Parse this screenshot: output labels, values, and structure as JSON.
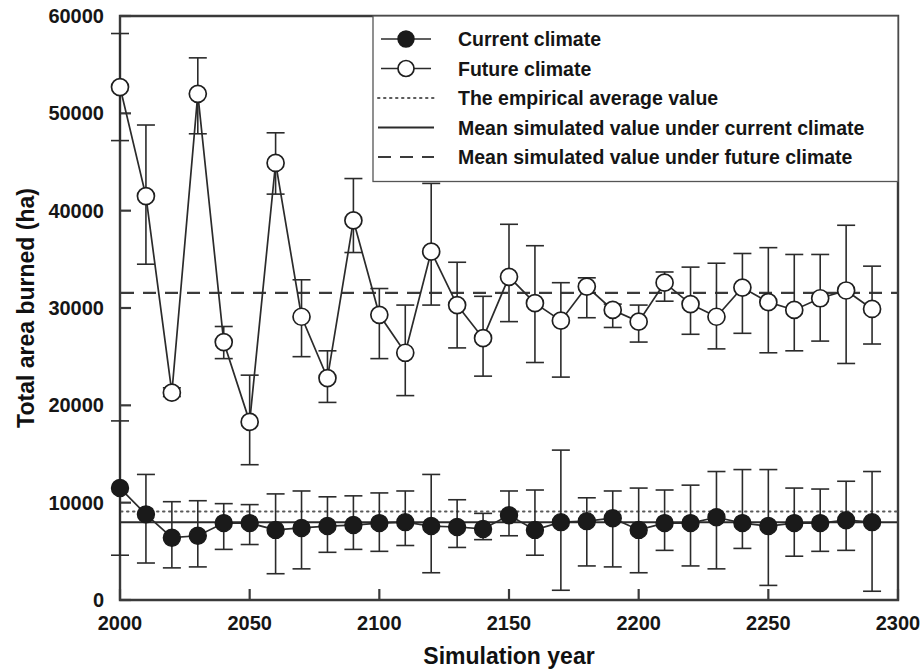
{
  "chart_data": {
    "type": "line",
    "title": "",
    "xlabel": "Simulation year",
    "ylabel": "Total area burned (ha)",
    "xlim": [
      2000,
      2300
    ],
    "ylim": [
      0,
      60000
    ],
    "xticks": [
      2000,
      2050,
      2100,
      2150,
      2200,
      2250,
      2300
    ],
    "yticks": [
      0,
      10000,
      20000,
      30000,
      40000,
      50000,
      60000
    ],
    "xtick_labels": [
      "2000",
      "2050",
      "2100",
      "2150",
      "2200",
      "2250",
      "2300"
    ],
    "ytick_labels": [
      "0",
      "10000",
      "20000",
      "30000",
      "40000",
      "50000",
      "60000"
    ],
    "grid": false,
    "legend_position": "top-right",
    "x": [
      2000,
      2010,
      2020,
      2030,
      2040,
      2050,
      2060,
      2070,
      2080,
      2090,
      2100,
      2110,
      2120,
      2130,
      2140,
      2150,
      2160,
      2170,
      2180,
      2190,
      2200,
      2210,
      2220,
      2230,
      2240,
      2250,
      2260,
      2270,
      2280,
      2290
    ],
    "series": [
      {
        "name": "Current climate",
        "marker": "filled-circle",
        "values": [
          11500,
          8800,
          6400,
          6600,
          7900,
          7900,
          7200,
          7400,
          7600,
          7700,
          7900,
          8000,
          7600,
          7500,
          7300,
          8700,
          7200,
          8000,
          8100,
          8400,
          7200,
          7900,
          7900,
          8500,
          7900,
          7600,
          7900,
          7900,
          8200,
          8000
        ],
        "err_low": [
          4600,
          3800,
          3300,
          3400,
          5200,
          5700,
          2700,
          3200,
          4900,
          5200,
          5000,
          5600,
          2800,
          5400,
          6200,
          6600,
          4600,
          1000,
          3500,
          3400,
          2800,
          5100,
          3500,
          3200,
          5300,
          1500,
          4500,
          5000,
          5100,
          900
        ],
        "err_high": [
          18400,
          12900,
          10100,
          10200,
          9900,
          9800,
          10900,
          11200,
          10600,
          10700,
          11000,
          11200,
          12900,
          10300,
          8900,
          11200,
          11300,
          15400,
          10500,
          11200,
          11500,
          11300,
          11800,
          13200,
          13400,
          13400,
          11500,
          11400,
          12200,
          13200
        ]
      },
      {
        "name": "Future climate",
        "marker": "open-circle",
        "values": [
          52700,
          41500,
          21300,
          52000,
          26500,
          18300,
          44900,
          29100,
          22800,
          39000,
          29300,
          25400,
          35800,
          30300,
          26900,
          33200,
          30500,
          28700,
          32200,
          29800,
          28600,
          32600,
          30400,
          29100,
          32100,
          30600,
          29800,
          31000,
          31800,
          29900
        ],
        "err_low": [
          47200,
          34500,
          20900,
          47900,
          24800,
          13900,
          41700,
          25000,
          20300,
          35700,
          24800,
          21000,
          30300,
          25900,
          23000,
          28600,
          24400,
          22900,
          29000,
          28000,
          26500,
          30700,
          27300,
          25800,
          27400,
          25400,
          25600,
          26600,
          24300,
          26300
        ],
        "err_high": [
          58200,
          48800,
          21800,
          55700,
          28100,
          23100,
          48000,
          32900,
          25600,
          43300,
          32000,
          30300,
          42800,
          34700,
          31200,
          38600,
          36400,
          32600,
          33100,
          30400,
          30300,
          33700,
          34200,
          34600,
          35600,
          36200,
          35500,
          35500,
          38500,
          34300
        ]
      }
    ],
    "reference_lines": [
      {
        "name": "The empirical average value",
        "style": "dotted",
        "value": 9100
      },
      {
        "name": "Mean simulated value under current climate",
        "style": "solid",
        "value": 8000
      },
      {
        "name": "Mean simulated value under future climate",
        "style": "dashed",
        "value": 31550
      }
    ],
    "legend": [
      {
        "label": "Current climate",
        "marker": "filled-circle",
        "style": "solid"
      },
      {
        "label": "Future climate",
        "marker": "open-circle",
        "style": "solid"
      },
      {
        "label": "The empirical average value",
        "marker": "none",
        "style": "dotted"
      },
      {
        "label": "Mean simulated value under current climate",
        "marker": "none",
        "style": "solid"
      },
      {
        "label": "Mean simulated value under future climate",
        "marker": "none",
        "style": "dashed"
      }
    ],
    "colors": {
      "axis": "#3a3a3a",
      "series": "#2b2b2b",
      "text": "#111111",
      "background": "#ffffff"
    }
  }
}
